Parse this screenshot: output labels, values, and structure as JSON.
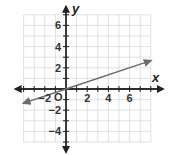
{
  "chart_data": {
    "type": "line",
    "title": "",
    "xlabel": "x",
    "ylabel": "y",
    "origin_label": "O",
    "xlim": [
      -4,
      8
    ],
    "ylim": [
      -5,
      7
    ],
    "grid": true,
    "x_ticks": [
      -2,
      2,
      4,
      6
    ],
    "x_tick_labels": [
      "−2",
      "2",
      "4",
      "6"
    ],
    "y_ticks": [
      6,
      4,
      2,
      -2,
      -4
    ],
    "y_tick_labels": [
      "6",
      "4",
      "2",
      "−2",
      "−4"
    ],
    "series": [
      {
        "name": "line",
        "equation": "y = x/3",
        "x": [
          -4,
          0,
          8
        ],
        "y": [
          -1.33,
          0,
          2.67
        ],
        "arrows_both_ends": true,
        "color": "#6b6b6b"
      }
    ],
    "legend": "none"
  },
  "colors": {
    "grid": "#d9d9d9",
    "axis": "#222222",
    "line": "#6b6b6b"
  }
}
